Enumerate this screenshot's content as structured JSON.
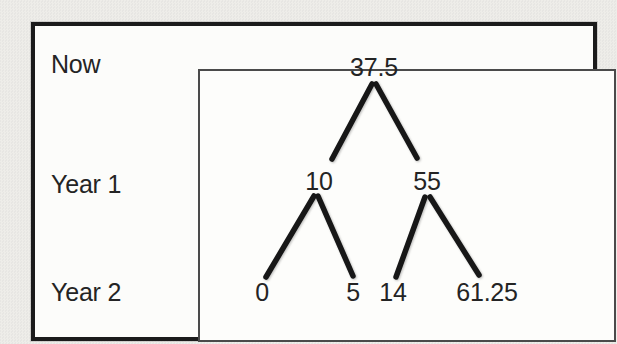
{
  "figure": {
    "rows": [
      {
        "label": "Now"
      },
      {
        "label": "Year 1"
      },
      {
        "label": "Year 2"
      }
    ],
    "tree": {
      "nodes": [
        {
          "id": "now",
          "row": "Now",
          "value": "37.5",
          "x": 374,
          "y": 67
        },
        {
          "id": "year1-down",
          "row": "Year 1",
          "value": "10",
          "x": 319,
          "y": 181
        },
        {
          "id": "year1-up",
          "row": "Year 1",
          "value": "55",
          "x": 427,
          "y": 181
        },
        {
          "id": "year2-dd",
          "row": "Year 2",
          "value": "0",
          "x": 262,
          "y": 292
        },
        {
          "id": "year2-du",
          "row": "Year 2",
          "value": "5",
          "x": 353,
          "y": 292
        },
        {
          "id": "year2-ud",
          "row": "Year 2",
          "value": "14",
          "x": 393,
          "y": 292
        },
        {
          "id": "year2-uu",
          "row": "Year 2",
          "value": "61.25",
          "x": 487,
          "y": 292
        }
      ],
      "edges": [
        {
          "from": "now",
          "to": "year1-down",
          "x1": 372,
          "y1": 84,
          "x2": 332,
          "y2": 159
        },
        {
          "from": "now",
          "to": "year1-up",
          "x1": 376,
          "y1": 84,
          "x2": 417,
          "y2": 158
        },
        {
          "from": "year1-down",
          "to": "year2-dd",
          "x1": 314,
          "y1": 196,
          "x2": 266,
          "y2": 277
        },
        {
          "from": "year1-down",
          "to": "year2-du",
          "x1": 318,
          "y1": 196,
          "x2": 353,
          "y2": 276
        },
        {
          "from": "year1-up",
          "to": "year2-ud",
          "x1": 425,
          "y1": 197,
          "x2": 396,
          "y2": 277
        },
        {
          "from": "year1-up",
          "to": "year2-uu",
          "x1": 430,
          "y1": 197,
          "x2": 479,
          "y2": 275
        }
      ]
    },
    "colors": {
      "page_background": "#e7e6e3",
      "frame_background": "#fcfcfa",
      "frame_border": "#1b1b1b",
      "plot_border": "#4a4a4a",
      "branch_line": "#171717",
      "text": "#242424"
    }
  }
}
